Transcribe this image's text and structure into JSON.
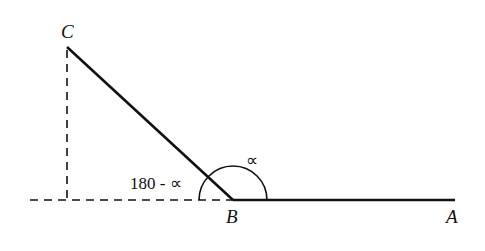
{
  "diagram": {
    "points": {
      "A": {
        "label": "A",
        "x": 455,
        "y": 200
      },
      "B": {
        "label": "B",
        "x": 233,
        "y": 200
      },
      "C": {
        "label": "C",
        "x": 67,
        "y": 47
      }
    },
    "angles": {
      "alpha": "∝",
      "supplement": "180 - ∝"
    },
    "colors": {
      "stroke": "#111111",
      "background": "#ffffff"
    }
  }
}
